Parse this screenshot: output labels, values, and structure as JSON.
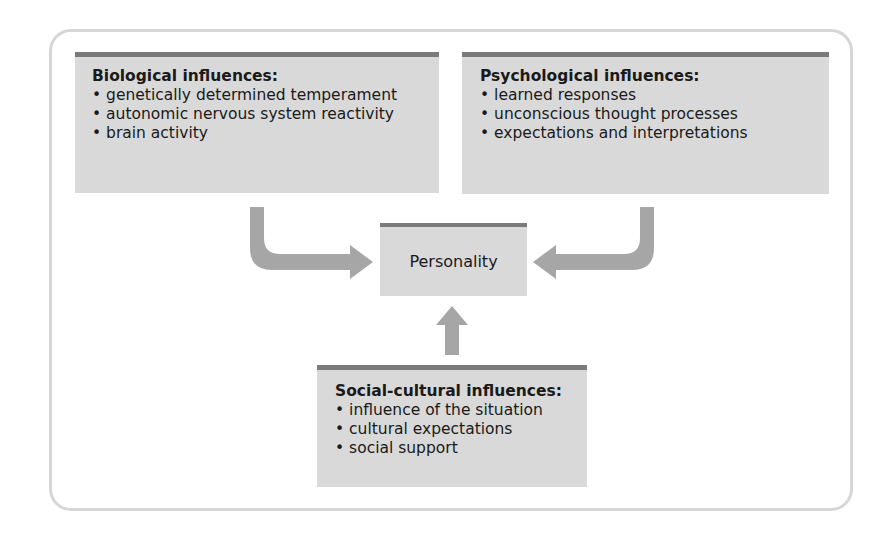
{
  "diagram": {
    "center": {
      "label": "Personality"
    },
    "biological": {
      "title": "Biological influences:",
      "items": [
        "genetically determined temperament",
        "autonomic nervous system reactivity",
        "brain activity"
      ]
    },
    "psychological": {
      "title": "Psychological influences:",
      "items": [
        "learned responses",
        "unconscious thought processes",
        "expectations and interpretations"
      ]
    },
    "social_cultural": {
      "title": "Social-cultural influences:",
      "items": [
        "influence of the situation",
        "cultural expectations",
        "social support"
      ]
    },
    "colors": {
      "box_fill": "#d9d9d9",
      "box_top_rule": "#7a7a7a",
      "arrow": "#a6a6a6",
      "frame": "#d6d6d6"
    }
  }
}
